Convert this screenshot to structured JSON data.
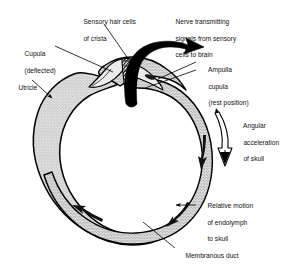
{
  "figure": {
    "type": "anatomical-line-diagram",
    "background_color": "#ffffff",
    "ink_color": "#000000",
    "fill_color": "#d9d9d9",
    "duct_fill_color": "#cfcfcf"
  },
  "labels": {
    "sensory_hair_cells": {
      "line1": "Sensory hair cells",
      "line2": "of crista"
    },
    "nerve": {
      "line1": "Nerve transmitting",
      "line2": "signals from sensory",
      "line3": "cells to brain"
    },
    "cupula_deflected": {
      "line1": "Cupula",
      "line2": "(deflected)"
    },
    "utricle": {
      "line1": "Utricle"
    },
    "ampulla_cupula": {
      "line1": "Ampulla",
      "line2": "cupula",
      "line3": "(rest position)"
    },
    "angular_acceleration": {
      "line1": "Angular",
      "line2": "acceleration",
      "line3": "of skull"
    },
    "relative_motion": {
      "line1": "Relative motion",
      "line2": "of endolymph",
      "line3": "to skull"
    },
    "membranous_duct": {
      "line1": "Membranous duct"
    }
  },
  "structures": {
    "utricle_name": "utricle-chamber",
    "membranous_duct_name": "membranous-duct-ring",
    "ampulla_name": "ampulla-chamber",
    "crista_name": "crista-ampullaris",
    "cupula_deflected_name": "cupula-deflected",
    "cupula_rest_name": "cupula-rest-position",
    "nerve_arrow_name": "nerve-arrow",
    "angular_arrow_name": "angular-acceleration-arrow",
    "endolymph_arrows_count": 3
  }
}
